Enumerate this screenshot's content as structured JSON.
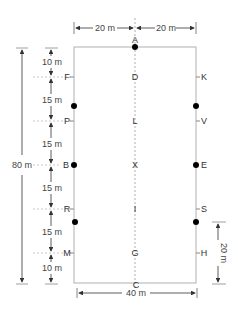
{
  "diagram": {
    "arena": {
      "width_m": 40,
      "length_m": 80
    },
    "letters": {
      "top": "A",
      "bottom": "C",
      "center": [
        "D",
        "L",
        "X",
        "I",
        "G"
      ],
      "left": [
        "F",
        "P",
        "B",
        "R",
        "M"
      ],
      "right": [
        "K",
        "V",
        "E",
        "S",
        "H"
      ]
    },
    "dimensions": {
      "top_left": "20 m",
      "top_right": "20 m",
      "bottom": "40 m",
      "total_length": "80 m",
      "segments": [
        "10 m",
        "15 m",
        "15 m",
        "15 m",
        "15 m",
        "10 m"
      ],
      "right_marker": "20 m"
    },
    "colors": {
      "line": "#aaaaaa",
      "text": "#333333",
      "dot": "#000000"
    }
  }
}
